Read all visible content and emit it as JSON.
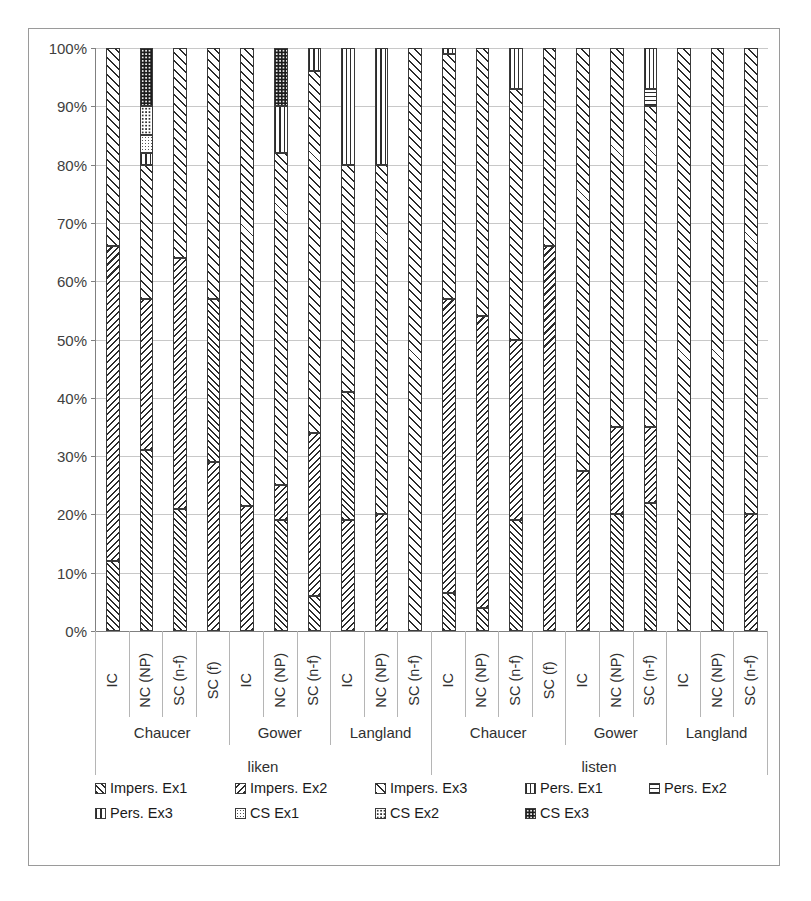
{
  "chart_data": {
    "type": "bar",
    "subtype": "stacked-100-percent",
    "title": "",
    "xlabel": "",
    "ylabel": "",
    "ylim": [
      0,
      100
    ],
    "ytick_labels": [
      "0%",
      "10%",
      "20%",
      "30%",
      "40%",
      "50%",
      "60%",
      "70%",
      "80%",
      "90%",
      "100%"
    ],
    "ytick_values": [
      0,
      10,
      20,
      30,
      40,
      50,
      60,
      70,
      80,
      90,
      100
    ],
    "grid": true,
    "legend_position": "bottom",
    "series": [
      {
        "name": "Impers. Ex1",
        "pattern": "diagonal-forward",
        "key": "p-impers1"
      },
      {
        "name": "Impers. Ex2",
        "pattern": "diagonal-backward",
        "key": "p-impers2"
      },
      {
        "name": "Impers. Ex3",
        "pattern": "crosshatch-diagonal",
        "key": "p-impers3"
      },
      {
        "name": "Pers. Ex1",
        "pattern": "vertical-lines",
        "key": "p-pers1"
      },
      {
        "name": "Pers. Ex2",
        "pattern": "horizontal-lines",
        "key": "p-pers2"
      },
      {
        "name": "Pers. Ex3",
        "pattern": "grid",
        "key": "p-pers3"
      },
      {
        "name": "CS Ex1",
        "pattern": "fine-dots",
        "key": "p-cs1"
      },
      {
        "name": "CS Ex2",
        "pattern": "medium-dots",
        "key": "p-cs2"
      },
      {
        "name": "CS Ex3",
        "pattern": "dense-dark-dots",
        "key": "p-cs3"
      }
    ],
    "group_levels": {
      "verbs": [
        "liken",
        "listen"
      ],
      "authors": [
        "Chaucer",
        "Gower",
        "Langland"
      ]
    },
    "categories": [
      {
        "verb": "liken",
        "author": "Chaucer",
        "label": "IC"
      },
      {
        "verb": "liken",
        "author": "Chaucer",
        "label": "NC (NP)"
      },
      {
        "verb": "liken",
        "author": "Chaucer",
        "label": "SC (n-f)"
      },
      {
        "verb": "liken",
        "author": "Chaucer",
        "label": "SC (f)"
      },
      {
        "verb": "liken",
        "author": "Gower",
        "label": "IC"
      },
      {
        "verb": "liken",
        "author": "Gower",
        "label": "NC (NP)"
      },
      {
        "verb": "liken",
        "author": "Gower",
        "label": "SC (n-f)"
      },
      {
        "verb": "liken",
        "author": "Langland",
        "label": "IC"
      },
      {
        "verb": "liken",
        "author": "Langland",
        "label": "NC (NP)"
      },
      {
        "verb": "liken",
        "author": "Langland",
        "label": "SC (n-f)"
      },
      {
        "verb": "listen",
        "author": "Chaucer",
        "label": "IC"
      },
      {
        "verb": "listen",
        "author": "Chaucer",
        "label": "NC (NP)"
      },
      {
        "verb": "listen",
        "author": "Chaucer",
        "label": "SC (n-f)"
      },
      {
        "verb": "listen",
        "author": "Chaucer",
        "label": "SC (f)"
      },
      {
        "verb": "listen",
        "author": "Gower",
        "label": "IC"
      },
      {
        "verb": "listen",
        "author": "Gower",
        "label": "NC (NP)"
      },
      {
        "verb": "listen",
        "author": "Gower",
        "label": "SC (n-f)"
      },
      {
        "verb": "listen",
        "author": "Langland",
        "label": "IC"
      },
      {
        "verb": "listen",
        "author": "Langland",
        "label": "NC (NP)"
      },
      {
        "verb": "listen",
        "author": "Langland",
        "label": "SC (n-f)"
      }
    ],
    "stacks": [
      {
        "category": "liken/Chaucer/IC",
        "segments": [
          {
            "s": "Impers. Ex1",
            "v": 12
          },
          {
            "s": "Impers. Ex2",
            "v": 54
          },
          {
            "s": "Impers. Ex3",
            "v": 34
          }
        ]
      },
      {
        "category": "liken/Chaucer/NC (NP)",
        "segments": [
          {
            "s": "Impers. Ex1",
            "v": 31
          },
          {
            "s": "Impers. Ex2",
            "v": 26
          },
          {
            "s": "Impers. Ex3",
            "v": 23
          },
          {
            "s": "Pers. Ex3",
            "v": 2
          },
          {
            "s": "CS Ex1",
            "v": 3
          },
          {
            "s": "CS Ex2",
            "v": 5
          },
          {
            "s": "CS Ex3",
            "v": 10
          }
        ]
      },
      {
        "category": "liken/Chaucer/SC (n-f)",
        "segments": [
          {
            "s": "Impers. Ex1",
            "v": 21
          },
          {
            "s": "Impers. Ex2",
            "v": 43
          },
          {
            "s": "Impers. Ex3",
            "v": 36
          }
        ]
      },
      {
        "category": "liken/Chaucer/SC (f)",
        "segments": [
          {
            "s": "Impers. Ex2",
            "v": 29
          },
          {
            "s": "Impers. Ex1",
            "v": 28
          },
          {
            "s": "Impers. Ex3",
            "v": 43
          }
        ]
      },
      {
        "category": "liken/Gower/IC",
        "segments": [
          {
            "s": "Impers. Ex2",
            "v": 21.5
          },
          {
            "s": "Impers. Ex3",
            "v": 78.5
          }
        ]
      },
      {
        "category": "liken/Gower/NC (NP)",
        "segments": [
          {
            "s": "Impers. Ex1",
            "v": 19
          },
          {
            "s": "Impers. Ex2",
            "v": 6
          },
          {
            "s": "Impers. Ex3",
            "v": 57
          },
          {
            "s": "Pers. Ex3",
            "v": 8
          },
          {
            "s": "CS Ex3",
            "v": 10
          }
        ]
      },
      {
        "category": "liken/Gower/SC (n-f)",
        "segments": [
          {
            "s": "Impers. Ex1",
            "v": 6
          },
          {
            "s": "Impers. Ex2",
            "v": 28
          },
          {
            "s": "Impers. Ex3",
            "v": 62
          },
          {
            "s": "Pers. Ex3",
            "v": 4
          }
        ]
      },
      {
        "category": "liken/Langland/IC",
        "segments": [
          {
            "s": "Impers. Ex2",
            "v": 19
          },
          {
            "s": "Impers. Ex1",
            "v": 22
          },
          {
            "s": "Impers. Ex3",
            "v": 39
          },
          {
            "s": "Pers. Ex1",
            "v": 20
          }
        ]
      },
      {
        "category": "liken/Langland/NC (NP)",
        "segments": [
          {
            "s": "Impers. Ex2",
            "v": 20
          },
          {
            "s": "Impers. Ex3",
            "v": 60
          },
          {
            "s": "Pers. Ex3",
            "v": 20
          }
        ]
      },
      {
        "category": "liken/Langland/SC (n-f)",
        "segments": [
          {
            "s": "Impers. Ex3",
            "v": 100
          }
        ]
      },
      {
        "category": "listen/Chaucer/IC",
        "segments": [
          {
            "s": "Impers. Ex1",
            "v": 6.5
          },
          {
            "s": "Impers. Ex2",
            "v": 50.5
          },
          {
            "s": "Impers. Ex3",
            "v": 42
          },
          {
            "s": "Pers. Ex3",
            "v": 1
          }
        ]
      },
      {
        "category": "listen/Chaucer/NC (NP)",
        "segments": [
          {
            "s": "Impers. Ex1",
            "v": 4
          },
          {
            "s": "Impers. Ex2",
            "v": 50
          },
          {
            "s": "Impers. Ex3",
            "v": 46
          }
        ]
      },
      {
        "category": "listen/Chaucer/SC (n-f)",
        "segments": [
          {
            "s": "Impers. Ex1",
            "v": 19
          },
          {
            "s": "Impers. Ex2",
            "v": 31
          },
          {
            "s": "Impers. Ex3",
            "v": 43
          },
          {
            "s": "Pers. Ex1",
            "v": 7
          }
        ]
      },
      {
        "category": "listen/Chaucer/SC (f)",
        "segments": [
          {
            "s": "Impers. Ex2",
            "v": 66
          },
          {
            "s": "Impers. Ex3",
            "v": 34
          }
        ]
      },
      {
        "category": "listen/Gower/IC",
        "segments": [
          {
            "s": "Impers. Ex2",
            "v": 27.5
          },
          {
            "s": "Impers. Ex3",
            "v": 72.5
          }
        ]
      },
      {
        "category": "listen/Gower/NC (NP)",
        "segments": [
          {
            "s": "Impers. Ex1",
            "v": 20
          },
          {
            "s": "Impers. Ex2",
            "v": 15
          },
          {
            "s": "Impers. Ex3",
            "v": 65
          }
        ]
      },
      {
        "category": "listen/Gower/SC (n-f)",
        "segments": [
          {
            "s": "Impers. Ex1",
            "v": 22
          },
          {
            "s": "Impers. Ex2",
            "v": 13
          },
          {
            "s": "Impers. Ex3",
            "v": 55
          },
          {
            "s": "Pers. Ex2",
            "v": 3
          },
          {
            "s": "Pers. Ex1",
            "v": 7
          }
        ]
      },
      {
        "category": "listen/Langland/IC",
        "segments": [
          {
            "s": "Impers. Ex3",
            "v": 100
          }
        ]
      },
      {
        "category": "listen/Langland/NC (NP)",
        "segments": [
          {
            "s": "Impers. Ex3",
            "v": 100
          }
        ]
      },
      {
        "category": "listen/Langland/SC (n-f)",
        "segments": [
          {
            "s": "Impers. Ex2",
            "v": 20
          },
          {
            "s": "Impers. Ex3",
            "v": 80
          }
        ]
      }
    ]
  },
  "legend": {
    "rows": [
      [
        {
          "label": "Impers. Ex1",
          "key": "p-impers1",
          "name": "legend-impers-ex1"
        },
        {
          "label": "Impers. Ex2",
          "key": "p-impers2",
          "name": "legend-impers-ex2"
        },
        {
          "label": "Impers. Ex3",
          "key": "p-impers3",
          "name": "legend-impers-ex3"
        },
        {
          "label": "Pers. Ex1",
          "key": "p-pers1",
          "name": "legend-pers-ex1"
        },
        {
          "label": "Pers. Ex2",
          "key": "p-pers2",
          "name": "legend-pers-ex2"
        }
      ],
      [
        {
          "label": "Pers. Ex3",
          "key": "p-pers3",
          "name": "legend-pers-ex3"
        },
        {
          "label": "CS Ex1",
          "key": "p-cs1",
          "name": "legend-cs-ex1"
        },
        {
          "label": "CS Ex2",
          "key": "p-cs2",
          "name": "legend-cs-ex2"
        },
        {
          "label": "CS Ex3",
          "key": "p-cs3",
          "name": "legend-cs-ex3"
        }
      ]
    ]
  }
}
